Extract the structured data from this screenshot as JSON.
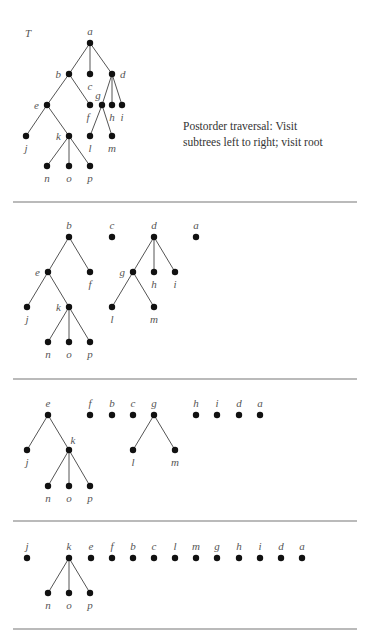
{
  "figure": {
    "tree_label": "T",
    "caption_line1": "Postorder traversal:  Visit",
    "caption_line2": "subtrees left to right; visit root"
  },
  "sections": [
    {
      "name": "original-tree",
      "nodes": {
        "a": [
          90,
          43,
          "top"
        ],
        "b": [
          69,
          74,
          "left"
        ],
        "c": [
          90,
          74,
          "bottom"
        ],
        "d": [
          112,
          74,
          "right"
        ],
        "e": [
          47,
          105,
          "left"
        ],
        "f": [
          90,
          105,
          "bottom-left"
        ],
        "g": [
          102,
          105,
          "top-left"
        ],
        "h": [
          112,
          105,
          "bottom"
        ],
        "i": [
          122,
          105,
          "bottom"
        ],
        "j": [
          26,
          136,
          "bottom"
        ],
        "k": [
          69,
          136,
          "left"
        ],
        "l": [
          90,
          136,
          "bottom"
        ],
        "m": [
          112,
          136,
          "bottom"
        ],
        "n": [
          47,
          166,
          "bottom"
        ],
        "o": [
          69,
          166,
          "bottom"
        ],
        "p": [
          90,
          166,
          "bottom"
        ]
      },
      "edges": [
        [
          "a",
          "b"
        ],
        [
          "a",
          "c"
        ],
        [
          "a",
          "d"
        ],
        [
          "b",
          "e"
        ],
        [
          "b",
          "f"
        ],
        [
          "d",
          "g"
        ],
        [
          "d",
          "h"
        ],
        [
          "d",
          "i"
        ],
        [
          "e",
          "j"
        ],
        [
          "e",
          "k"
        ],
        [
          "g",
          "l"
        ],
        [
          "g",
          "m"
        ],
        [
          "k",
          "n"
        ],
        [
          "k",
          "o"
        ],
        [
          "k",
          "p"
        ]
      ]
    },
    {
      "name": "step-1",
      "nodes": {
        "b": [
          69,
          237,
          "top"
        ],
        "c": [
          112,
          237,
          "top"
        ],
        "d": [
          154,
          237,
          "top"
        ],
        "a": [
          196,
          237,
          "top"
        ],
        "e": [
          48,
          272,
          "left"
        ],
        "f": [
          90,
          272,
          "bottom"
        ],
        "g": [
          133,
          272,
          "left"
        ],
        "h": [
          154,
          272,
          "bottom"
        ],
        "i": [
          175,
          272,
          "bottom"
        ],
        "j": [
          27,
          307,
          "bottom"
        ],
        "k": [
          69,
          307,
          "left"
        ],
        "l": [
          112,
          307,
          "bottom"
        ],
        "m": [
          154,
          307,
          "bottom"
        ],
        "n": [
          48,
          342,
          "bottom"
        ],
        "o": [
          69,
          342,
          "bottom"
        ],
        "p": [
          90,
          342,
          "bottom"
        ]
      },
      "edges": [
        [
          "b",
          "e"
        ],
        [
          "b",
          "f"
        ],
        [
          "d",
          "g"
        ],
        [
          "d",
          "h"
        ],
        [
          "d",
          "i"
        ],
        [
          "e",
          "j"
        ],
        [
          "e",
          "k"
        ],
        [
          "g",
          "l"
        ],
        [
          "g",
          "m"
        ],
        [
          "k",
          "n"
        ],
        [
          "k",
          "o"
        ],
        [
          "k",
          "p"
        ]
      ]
    },
    {
      "name": "step-2",
      "nodes": {
        "e": [
          48,
          415,
          "top"
        ],
        "f": [
          90,
          415,
          "top"
        ],
        "b": [
          112,
          415,
          "top"
        ],
        "c": [
          133,
          415,
          "top"
        ],
        "g": [
          154,
          415,
          "top"
        ],
        "h": [
          196,
          415,
          "top"
        ],
        "i": [
          217,
          415,
          "top"
        ],
        "d": [
          239,
          415,
          "top"
        ],
        "a": [
          260,
          415,
          "top"
        ],
        "j": [
          27,
          450,
          "bottom"
        ],
        "k": [
          69,
          450,
          "top-right"
        ],
        "l": [
          133,
          450,
          "bottom"
        ],
        "m": [
          175,
          450,
          "bottom"
        ],
        "n": [
          48,
          486,
          "bottom"
        ],
        "o": [
          69,
          486,
          "bottom"
        ],
        "p": [
          90,
          486,
          "bottom"
        ]
      },
      "edges": [
        [
          "e",
          "j"
        ],
        [
          "e",
          "k"
        ],
        [
          "g",
          "l"
        ],
        [
          "g",
          "m"
        ],
        [
          "k",
          "n"
        ],
        [
          "k",
          "o"
        ],
        [
          "k",
          "p"
        ]
      ]
    },
    {
      "name": "step-3",
      "nodes": {
        "j": [
          27,
          558,
          "top"
        ],
        "k": [
          69,
          558,
          "top"
        ],
        "e": [
          91,
          558,
          "top"
        ],
        "f": [
          112,
          558,
          "top"
        ],
        "b": [
          133,
          558,
          "top"
        ],
        "c": [
          154,
          558,
          "top"
        ],
        "l": [
          175,
          558,
          "top"
        ],
        "m": [
          196,
          558,
          "top"
        ],
        "g": [
          217,
          558,
          "top"
        ],
        "h": [
          239,
          558,
          "top"
        ],
        "i": [
          260,
          558,
          "top"
        ],
        "d": [
          281,
          558,
          "top"
        ],
        "a": [
          302,
          558,
          "top"
        ],
        "n": [
          48,
          593,
          "bottom"
        ],
        "o": [
          69,
          593,
          "bottom"
        ],
        "p": [
          90,
          593,
          "bottom"
        ]
      },
      "edges": [
        [
          "k",
          "n"
        ],
        [
          "k",
          "o"
        ],
        [
          "k",
          "p"
        ]
      ]
    }
  ],
  "dividers_y": [
    202,
    379,
    521,
    629
  ]
}
